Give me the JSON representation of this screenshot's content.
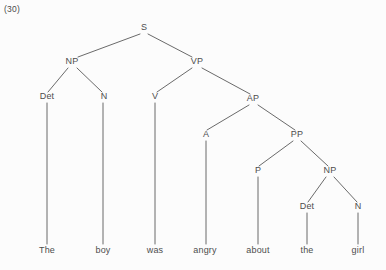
{
  "figure": {
    "example_number": "(30)",
    "sentence": "The boy was angry about the girl",
    "line_color": "#595959",
    "text_color": "#4d4d4d",
    "background_color": "#fcfcfc"
  },
  "tree": {
    "nodes": [
      {
        "id": "S",
        "label": "S",
        "x": 144,
        "y": 30
      },
      {
        "id": "NP1",
        "label": "NP",
        "x": 72,
        "y": 64
      },
      {
        "id": "VP",
        "label": "VP",
        "x": 197,
        "y": 64
      },
      {
        "id": "Det1",
        "label": "Det",
        "x": 47,
        "y": 99
      },
      {
        "id": "N1",
        "label": "N",
        "x": 104,
        "y": 99
      },
      {
        "id": "V",
        "label": "V",
        "x": 155,
        "y": 99
      },
      {
        "id": "AP",
        "label": "AP",
        "x": 253,
        "y": 101
      },
      {
        "id": "A",
        "label": "A",
        "x": 206,
        "y": 137
      },
      {
        "id": "PP",
        "label": "PP",
        "x": 297,
        "y": 137
      },
      {
        "id": "P",
        "label": "P",
        "x": 258,
        "y": 173
      },
      {
        "id": "NP2",
        "label": "NP",
        "x": 330,
        "y": 173
      },
      {
        "id": "Det2",
        "label": "Det",
        "x": 307,
        "y": 209
      },
      {
        "id": "N2",
        "label": "N",
        "x": 358,
        "y": 209
      }
    ],
    "leaves": [
      {
        "id": "w1",
        "label": "The",
        "x": 47,
        "y": 253
      },
      {
        "id": "w2",
        "label": "boy",
        "x": 103,
        "y": 253
      },
      {
        "id": "w3",
        "label": "was",
        "x": 155,
        "y": 253
      },
      {
        "id": "w4",
        "label": "angry",
        "x": 205,
        "y": 253
      },
      {
        "id": "w5",
        "label": "about",
        "x": 258,
        "y": 253
      },
      {
        "id": "w6",
        "label": "the",
        "x": 307,
        "y": 253
      },
      {
        "id": "w7",
        "label": "girl",
        "x": 358,
        "y": 253
      }
    ],
    "edges": [
      {
        "from": "S",
        "to": "NP1",
        "x1": 140,
        "y1": 34,
        "x2": 78,
        "y2": 57
      },
      {
        "from": "S",
        "to": "VP",
        "x1": 148,
        "y1": 34,
        "x2": 192,
        "y2": 57
      },
      {
        "from": "NP1",
        "to": "Det1",
        "x1": 68,
        "y1": 68,
        "x2": 48,
        "y2": 92
      },
      {
        "from": "NP1",
        "to": "N1",
        "x1": 77,
        "y1": 68,
        "x2": 102,
        "y2": 92
      },
      {
        "from": "VP",
        "to": "V",
        "x1": 192,
        "y1": 68,
        "x2": 157,
        "y2": 92
      },
      {
        "from": "VP",
        "to": "AP",
        "x1": 202,
        "y1": 68,
        "x2": 250,
        "y2": 94
      },
      {
        "from": "AP",
        "to": "A",
        "x1": 249,
        "y1": 105,
        "x2": 207,
        "y2": 130
      },
      {
        "from": "AP",
        "to": "PP",
        "x1": 258,
        "y1": 105,
        "x2": 295,
        "y2": 130
      },
      {
        "from": "PP",
        "to": "P",
        "x1": 293,
        "y1": 141,
        "x2": 259,
        "y2": 166
      },
      {
        "from": "PP",
        "to": "NP2",
        "x1": 301,
        "y1": 141,
        "x2": 328,
        "y2": 166
      },
      {
        "from": "NP2",
        "to": "Det2",
        "x1": 326,
        "y1": 177,
        "x2": 308,
        "y2": 202
      },
      {
        "from": "NP2",
        "to": "N2",
        "x1": 334,
        "y1": 177,
        "x2": 357,
        "y2": 202
      },
      {
        "from": "Det1",
        "to": "w1",
        "x1": 47,
        "y1": 103,
        "x2": 47,
        "y2": 244
      },
      {
        "from": "N1",
        "to": "w2",
        "x1": 103,
        "y1": 103,
        "x2": 103,
        "y2": 244
      },
      {
        "from": "V",
        "to": "w3",
        "x1": 155,
        "y1": 103,
        "x2": 155,
        "y2": 244
      },
      {
        "from": "A",
        "to": "w4",
        "x1": 206,
        "y1": 141,
        "x2": 206,
        "y2": 244
      },
      {
        "from": "P",
        "to": "w5",
        "x1": 258,
        "y1": 177,
        "x2": 258,
        "y2": 244
      },
      {
        "from": "Det2",
        "to": "w6",
        "x1": 307,
        "y1": 213,
        "x2": 307,
        "y2": 244
      },
      {
        "from": "N2",
        "to": "w7",
        "x1": 358,
        "y1": 213,
        "x2": 358,
        "y2": 244
      }
    ]
  }
}
